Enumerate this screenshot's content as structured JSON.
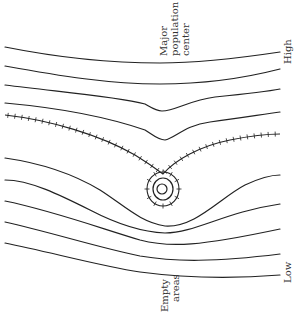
{
  "diagram": {
    "type": "contour-diagram",
    "labels": {
      "top_center": [
        "Major",
        "population",
        "center"
      ],
      "bottom_center": [
        "Empty",
        "areas"
      ],
      "right_top": "High",
      "right_bottom": "Low"
    },
    "contours": [
      "M5,47 C60,58 110,63 160,63 C200,63 240,58 280,52",
      "M5,66 C60,76 110,84 160,84 C200,84 245,78 280,69",
      "M5,85 C60,92 115,96 145,104 C152,108 156,111 162,111 C175,111 190,100 215,97 C245,94 265,92 280,89",
      "M5,103 C60,108 110,118 145,130 C153,135 158,140 165,140 C175,138 185,125 210,122 C240,118 265,114 280,112",
      "M5,158 C40,163 70,172 100,190 C125,206 140,222 165,226 C195,228 220,198 245,185 C262,177 272,175 280,175",
      "M5,180 C30,180 60,195 90,210 C115,223 140,232 165,233 C195,233 225,212 280,204",
      "M5,201 C50,210 100,228 140,240 C170,248 200,246 280,229",
      "M5,222 C50,232 100,248 140,256 C175,262 215,262 280,254",
      "M5,243 C50,252 100,266 140,272 C185,278 230,279 280,275"
    ],
    "inner_loops": [
      {
        "cx": 163,
        "cy": 189,
        "rx": 10,
        "ry": 11
      },
      {
        "cx": 162,
        "cy": 189,
        "rx": 5,
        "ry": 5
      }
    ],
    "ridge_lines": [
      "M5,115 C50,120 100,135 135,155 C148,163 155,168 163,174",
      "M163,174 C175,160 200,146 230,140 C255,135 270,134 280,134"
    ],
    "tick_loop": {
      "cx": 163,
      "cy": 189,
      "rx": 16,
      "ry": 17
    },
    "colors": {
      "line": "#222222",
      "text": "#333333",
      "background": "#ffffff"
    }
  }
}
